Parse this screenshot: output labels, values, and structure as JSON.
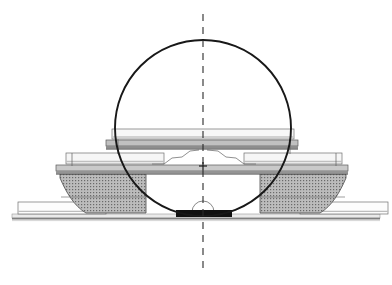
{
  "document": {
    "type": "architectural-section-drawing",
    "title": "Section through domed hall and stepped podium",
    "orientation": "portrait-landscape",
    "canvas": {
      "width": 392,
      "height": 285
    },
    "background_color": "#ffffff",
    "scale_note": "",
    "caption": ""
  },
  "palette": {
    "ink": "#1b1b1b",
    "dome_stroke": "#181818",
    "centerline": "#2b2b2b",
    "hatch_fill": "#b8b8b8",
    "hatch_dot": "#6e6e6e",
    "slab_light": "#f2f2f2",
    "slab_mid": "#cfcfcf",
    "slab_dark": "#a8a8a8",
    "solid_black": "#111111",
    "ground_line": "#8c8c8c",
    "thin_line": "#707070",
    "white": "#ffffff"
  },
  "geometry": {
    "dome": {
      "name": "dome-circle",
      "center_x": 203,
      "center_y": 128,
      "radius": 88,
      "stroke_width": 1.9,
      "fill": "none"
    },
    "centerline": {
      "name": "vertical-centerline",
      "x": 203,
      "y_top": 14,
      "y_bottom": 273,
      "dash": "7 6",
      "stroke_width": 1.1
    },
    "center_mark": {
      "name": "center-cross-mark",
      "x": 203,
      "y": 166,
      "size": 4
    },
    "base_arc": {
      "name": "base-semicircle-arc",
      "center_x": 203,
      "center_y": 213,
      "radius": 11
    },
    "ground": {
      "name": "ground-line",
      "x_start": 12,
      "x_end": 380,
      "y": 219,
      "thickness": 2
    }
  },
  "layers": {
    "upper_roof_slab": {
      "name": "upper-roof-slab",
      "x": 113,
      "y": 130,
      "width": 180,
      "height": 9,
      "fill": "#f4f4f4",
      "stroke": "#6f6f6f"
    },
    "roof_deck_band": {
      "name": "roof-deck-band",
      "x": 108,
      "y": 140,
      "width": 190,
      "height": 6,
      "fill": "#bdbdbd",
      "stroke": "#5a5a5a"
    },
    "roof_shadow_band": {
      "name": "roof-shadow-band",
      "x": 108,
      "y": 146,
      "width": 190,
      "height": 3,
      "fill": "#8f8f8f",
      "stroke": "none"
    },
    "mid_left_slab": {
      "name": "mid-left-slab",
      "x": 68,
      "y": 154,
      "width": 94,
      "height": 10,
      "fill": "#f4f4f4",
      "stroke": "#6f6f6f"
    },
    "mid_right_slab": {
      "name": "mid-right-slab",
      "x": 246,
      "y": 154,
      "width": 94,
      "height": 10,
      "fill": "#f4f4f4",
      "stroke": "#6f6f6f"
    },
    "gallery_deck_band": {
      "name": "gallery-deck-band",
      "x": 58,
      "y": 165,
      "width": 290,
      "height": 6,
      "fill": "#c6c6c6",
      "stroke": "#5a5a5a"
    },
    "gallery_shadow_band": {
      "name": "gallery-shadow-band",
      "x": 58,
      "y": 171,
      "width": 290,
      "height": 3,
      "fill": "#909090",
      "stroke": "none"
    },
    "left_pier": {
      "name": "left-pier-hatched",
      "fill": "#b9b9b9",
      "stroke": "#4a4a4a",
      "hatch": "dotted-grid"
    },
    "right_pier": {
      "name": "right-pier-hatched",
      "fill": "#b9b9b9",
      "stroke": "#4a4a4a",
      "hatch": "dotted-grid"
    },
    "lower_left_apron": {
      "name": "lower-left-apron-slab",
      "x": 18,
      "y": 202,
      "width": 86,
      "height": 12,
      "fill": "#fbfbfb",
      "stroke": "#6f6f6f"
    },
    "lower_right_apron": {
      "name": "lower-right-apron-slab",
      "x": 302,
      "y": 202,
      "width": 86,
      "height": 12,
      "fill": "#fbfbfb",
      "stroke": "#6f6f6f"
    },
    "threshold_block": {
      "name": "threshold-solid-block",
      "x": 176,
      "y": 210,
      "width": 56,
      "height": 7,
      "fill": "#111111"
    },
    "plinth_band": {
      "name": "plinth-band",
      "x": 12,
      "y": 214,
      "width": 368,
      "height": 4,
      "fill": "#e6e6e6",
      "stroke": "#8c8c8c"
    }
  },
  "piers": {
    "left": {
      "name": "left-pier",
      "outline_points": "60,174 146,174 146,213 78,213 70,206 62,192",
      "top_y": 174,
      "bottom_y": 213
    },
    "right": {
      "name": "right-pier",
      "outline_points": "260,174 346,174 344,192 336,206 328,213 260,213",
      "top_y": 174,
      "bottom_y": 213
    }
  },
  "detail_lines": {
    "left_vault_polyline": "146,176 162,163 176,157 186,150 196,148",
    "right_vault_polyline": "260,176 244,163 230,157 220,150 210,148",
    "left_hanger": "72,152 72,166",
    "right_hanger": "334,152 334,166",
    "left_inner_hanger": "118,139 118,157",
    "right_inner_hanger": "288,139 288,157",
    "left_pier_seam": "62,197 146,197",
    "right_pier_seam": "260,197 344,197"
  },
  "annotations": {
    "items": [],
    "visible_text": []
  }
}
